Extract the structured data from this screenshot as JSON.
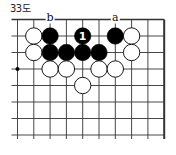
{
  "diagram": {
    "title": "33도",
    "board": {
      "columns": 10,
      "rows": 8,
      "edges": [
        "top",
        "right"
      ],
      "hoshi": [
        {
          "col": 0,
          "row": 3
        }
      ]
    },
    "stones": [
      {
        "color": "white",
        "col": 1,
        "row": 1
      },
      {
        "color": "black",
        "col": 2,
        "row": 1
      },
      {
        "color": "black",
        "col": 4,
        "row": 1,
        "label": "1"
      },
      {
        "color": "black",
        "col": 6,
        "row": 1
      },
      {
        "color": "white",
        "col": 7,
        "row": 1
      },
      {
        "color": "white",
        "col": 1,
        "row": 2
      },
      {
        "color": "black",
        "col": 2,
        "row": 2
      },
      {
        "color": "black",
        "col": 3,
        "row": 2
      },
      {
        "color": "black",
        "col": 4,
        "row": 2
      },
      {
        "color": "black",
        "col": 5,
        "row": 2
      },
      {
        "color": "white",
        "col": 7,
        "row": 2
      },
      {
        "color": "white",
        "col": 2,
        "row": 3
      },
      {
        "color": "white",
        "col": 3,
        "row": 3
      },
      {
        "color": "white",
        "col": 5,
        "row": 3
      },
      {
        "color": "white",
        "col": 6,
        "row": 3
      },
      {
        "color": "white",
        "col": 4,
        "row": 4
      }
    ],
    "point_labels": [
      {
        "text": "b",
        "col": 2,
        "row": 0
      },
      {
        "text": "a",
        "col": 6,
        "row": 0
      }
    ],
    "colors": {
      "line": "#333333",
      "black_stone": "#000000",
      "white_stone": "#ffffff",
      "stone_label_on_black": "#ffffff"
    }
  }
}
